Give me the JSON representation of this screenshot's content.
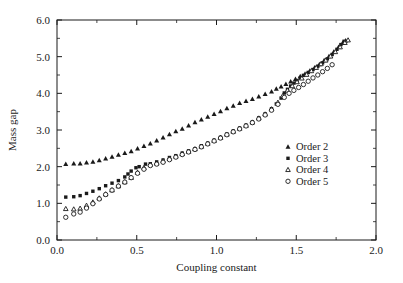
{
  "chart_data": {
    "type": "scatter",
    "title": "",
    "xlabel": "Coupling constant",
    "ylabel": "Mass gap",
    "xlim": [
      0.0,
      2.0
    ],
    "ylim": [
      0.0,
      6.0
    ],
    "xticks": [
      "0.0",
      "0.5",
      "1.0",
      "1.5",
      "2.0"
    ],
    "xtick_values": [
      0.0,
      0.5,
      1.0,
      1.5,
      2.0
    ],
    "yticks": [
      "0.0",
      "1.0",
      "2.0",
      "3.0",
      "4.0",
      "5.0",
      "6.0"
    ],
    "ytick_values": [
      0.0,
      1.0,
      2.0,
      3.0,
      4.0,
      5.0,
      6.0
    ],
    "x_minor_step": 0.25,
    "y_minor_step": 0.5,
    "grid": false,
    "legend_position": "right-center-inside",
    "series": [
      {
        "name": "Order 2",
        "marker": "filled-triangle",
        "color": "#1a1a1a",
        "points": [
          [
            0.055,
            2.07
          ],
          [
            0.105,
            2.08
          ],
          [
            0.145,
            2.08
          ],
          [
            0.185,
            2.11
          ],
          [
            0.225,
            2.13
          ],
          [
            0.265,
            2.17
          ],
          [
            0.305,
            2.22
          ],
          [
            0.345,
            2.27
          ],
          [
            0.385,
            2.32
          ],
          [
            0.425,
            2.37
          ],
          [
            0.465,
            2.42
          ],
          [
            0.505,
            2.49
          ],
          [
            0.545,
            2.56
          ],
          [
            0.585,
            2.63
          ],
          [
            0.625,
            2.71
          ],
          [
            0.665,
            2.79
          ],
          [
            0.705,
            2.88
          ],
          [
            0.745,
            2.96
          ],
          [
            0.785,
            3.03
          ],
          [
            0.825,
            3.12
          ],
          [
            0.865,
            3.21
          ],
          [
            0.905,
            3.28
          ],
          [
            0.945,
            3.36
          ],
          [
            0.985,
            3.43
          ],
          [
            1.025,
            3.51
          ],
          [
            1.065,
            3.59
          ],
          [
            1.105,
            3.66
          ],
          [
            1.145,
            3.73
          ],
          [
            1.185,
            3.79
          ],
          [
            1.225,
            3.84
          ],
          [
            1.265,
            3.91
          ],
          [
            1.305,
            3.98
          ],
          [
            1.345,
            4.05
          ],
          [
            1.375,
            4.12
          ],
          [
            1.405,
            4.18
          ],
          [
            1.435,
            4.25
          ],
          [
            1.465,
            4.32
          ],
          [
            1.495,
            4.39
          ],
          [
            1.525,
            4.46
          ],
          [
            1.555,
            4.53
          ],
          [
            1.585,
            4.61
          ],
          [
            1.615,
            4.7
          ],
          [
            1.645,
            4.79
          ],
          [
            1.675,
            4.9
          ],
          [
            1.705,
            5.01
          ],
          [
            1.735,
            5.13
          ],
          [
            1.765,
            5.26
          ],
          [
            1.79,
            5.37
          ],
          [
            1.81,
            5.44
          ]
        ]
      },
      {
        "name": "Order 3",
        "marker": "filled-square",
        "color": "#1a1a1a",
        "points": [
          [
            0.055,
            1.17
          ],
          [
            0.105,
            1.18
          ],
          [
            0.145,
            1.21
          ],
          [
            0.185,
            1.27
          ],
          [
            0.225,
            1.33
          ],
          [
            0.265,
            1.4
          ],
          [
            0.305,
            1.48
          ],
          [
            0.345,
            1.55
          ],
          [
            0.385,
            1.62
          ],
          [
            0.425,
            1.72
          ],
          [
            0.445,
            1.8
          ],
          [
            0.465,
            1.88
          ],
          [
            0.495,
            1.97
          ],
          [
            0.515,
            2.0
          ],
          [
            0.555,
            2.07
          ],
          [
            0.585,
            2.08
          ],
          [
            0.625,
            2.13
          ],
          [
            0.665,
            2.18
          ],
          [
            0.705,
            2.25
          ],
          [
            0.745,
            2.3
          ],
          [
            0.785,
            2.37
          ],
          [
            0.825,
            2.43
          ],
          [
            0.865,
            2.49
          ],
          [
            0.905,
            2.57
          ],
          [
            0.945,
            2.64
          ],
          [
            0.985,
            2.72
          ],
          [
            1.025,
            2.8
          ],
          [
            1.065,
            2.89
          ],
          [
            1.105,
            2.97
          ],
          [
            1.145,
            3.05
          ],
          [
            1.185,
            3.13
          ],
          [
            1.225,
            3.22
          ],
          [
            1.265,
            3.33
          ],
          [
            1.305,
            3.44
          ],
          [
            1.345,
            3.58
          ],
          [
            1.375,
            3.71
          ],
          [
            1.405,
            3.87
          ],
          [
            1.425,
            4.01
          ],
          [
            1.445,
            4.11
          ],
          [
            1.465,
            4.2
          ],
          [
            1.485,
            4.28
          ],
          [
            1.505,
            4.35
          ],
          [
            1.525,
            4.42
          ],
          [
            1.545,
            4.49
          ],
          [
            1.575,
            4.57
          ],
          [
            1.605,
            4.65
          ],
          [
            1.635,
            4.74
          ],
          [
            1.665,
            4.83
          ],
          [
            1.695,
            4.94
          ],
          [
            1.725,
            5.06
          ],
          [
            1.755,
            5.2
          ],
          [
            1.78,
            5.33
          ],
          [
            1.8,
            5.42
          ]
        ]
      },
      {
        "name": "Order 4",
        "marker": "open-triangle",
        "color": "#1a1a1a",
        "points": [
          [
            0.055,
            0.85
          ],
          [
            0.105,
            0.84
          ],
          [
            0.145,
            0.86
          ],
          [
            0.185,
            0.94
          ],
          [
            0.225,
            1.03
          ],
          [
            0.265,
            1.14
          ],
          [
            0.305,
            1.25
          ],
          [
            0.345,
            1.36
          ],
          [
            0.385,
            1.47
          ],
          [
            0.425,
            1.58
          ],
          [
            0.465,
            1.7
          ],
          [
            0.505,
            1.84
          ],
          [
            0.545,
            1.97
          ],
          [
            0.585,
            2.06
          ],
          [
            0.625,
            2.09
          ],
          [
            0.665,
            2.16
          ],
          [
            0.705,
            2.22
          ],
          [
            0.745,
            2.28
          ],
          [
            0.785,
            2.35
          ],
          [
            0.825,
            2.41
          ],
          [
            0.865,
            2.48
          ],
          [
            0.905,
            2.55
          ],
          [
            0.945,
            2.63
          ],
          [
            0.985,
            2.71
          ],
          [
            1.025,
            2.79
          ],
          [
            1.065,
            2.88
          ],
          [
            1.105,
            2.96
          ],
          [
            1.145,
            3.04
          ],
          [
            1.185,
            3.12
          ],
          [
            1.225,
            3.21
          ],
          [
            1.265,
            3.32
          ],
          [
            1.305,
            3.43
          ],
          [
            1.345,
            3.57
          ],
          [
            1.385,
            3.75
          ],
          [
            1.415,
            3.93
          ],
          [
            1.445,
            4.08
          ],
          [
            1.475,
            4.2
          ],
          [
            1.505,
            4.31
          ],
          [
            1.535,
            4.41
          ],
          [
            1.565,
            4.51
          ],
          [
            1.595,
            4.61
          ],
          [
            1.625,
            4.7
          ],
          [
            1.655,
            4.8
          ],
          [
            1.685,
            4.9
          ],
          [
            1.715,
            5.01
          ],
          [
            1.745,
            5.13
          ],
          [
            1.775,
            5.26
          ],
          [
            1.805,
            5.38
          ],
          [
            1.825,
            5.45
          ]
        ]
      },
      {
        "name": "Order 5",
        "marker": "open-circle",
        "color": "#1a1a1a",
        "points": [
          [
            0.055,
            0.62
          ],
          [
            0.105,
            0.71
          ],
          [
            0.145,
            0.76
          ],
          [
            0.185,
            0.87
          ],
          [
            0.225,
            0.99
          ],
          [
            0.265,
            1.12
          ],
          [
            0.305,
            1.24
          ],
          [
            0.345,
            1.36
          ],
          [
            0.385,
            1.47
          ],
          [
            0.425,
            1.58
          ],
          [
            0.465,
            1.7
          ],
          [
            0.505,
            1.82
          ],
          [
            0.545,
            1.93
          ],
          [
            0.585,
            2.03
          ],
          [
            0.625,
            2.07
          ],
          [
            0.665,
            2.12
          ],
          [
            0.705,
            2.19
          ],
          [
            0.745,
            2.26
          ],
          [
            0.785,
            2.33
          ],
          [
            0.825,
            2.4
          ],
          [
            0.865,
            2.47
          ],
          [
            0.905,
            2.54
          ],
          [
            0.945,
            2.62
          ],
          [
            0.985,
            2.7
          ],
          [
            1.025,
            2.78
          ],
          [
            1.065,
            2.87
          ],
          [
            1.105,
            2.95
          ],
          [
            1.145,
            3.03
          ],
          [
            1.185,
            3.11
          ],
          [
            1.225,
            3.2
          ],
          [
            1.265,
            3.3
          ],
          [
            1.305,
            3.41
          ],
          [
            1.345,
            3.54
          ],
          [
            1.385,
            3.7
          ],
          [
            1.425,
            3.89
          ],
          [
            1.455,
            4.0
          ],
          [
            1.485,
            4.08
          ],
          [
            1.515,
            4.16
          ],
          [
            1.545,
            4.24
          ],
          [
            1.575,
            4.33
          ],
          [
            1.605,
            4.42
          ],
          [
            1.635,
            4.5
          ],
          [
            1.665,
            4.59
          ],
          [
            1.695,
            4.68
          ],
          [
            1.725,
            4.78
          ]
        ]
      }
    ]
  }
}
